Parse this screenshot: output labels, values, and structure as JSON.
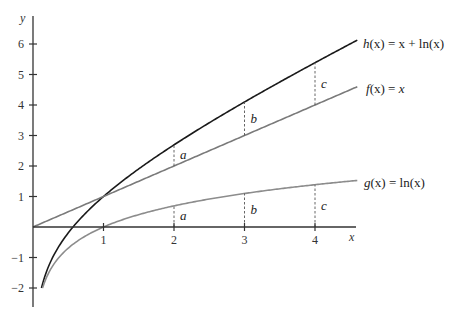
{
  "chart_data": {
    "type": "line",
    "title": "",
    "xlabel": "x",
    "ylabel": "y",
    "xlim": [
      0,
      4.6
    ],
    "ylim": [
      -2.5,
      6.9
    ],
    "grid": false,
    "x_ticks": [
      1,
      2,
      3,
      4
    ],
    "x_tick_labels": [
      "1",
      "2",
      "3",
      "4"
    ],
    "y_ticks": [
      -2,
      -1,
      1,
      2,
      3,
      4,
      5,
      6
    ],
    "y_tick_labels": [
      "−2",
      "−1",
      "1",
      "2",
      "3",
      "4",
      "5",
      "6"
    ],
    "series": [
      {
        "name": "h(x) = x + ln(x)",
        "label_parts": {
          "fn": "h",
          "rhs": "x + ln(x)"
        },
        "color": "#1a1a1a",
        "formula": "x+ln(x)",
        "domain": [
          0.12,
          4.6
        ]
      },
      {
        "name": "f(x) = x",
        "label_parts": {
          "fn": "f",
          "rhs": "x"
        },
        "color": "#7a7a7a",
        "formula": "x",
        "domain": [
          0,
          4.6
        ]
      },
      {
        "name": "g(x) = ln(x)",
        "label_parts": {
          "fn": "g",
          "rhs": "ln(x)"
        },
        "color": "#8c8c8c",
        "formula": "ln(x)",
        "domain": [
          0.135,
          4.6
        ]
      }
    ],
    "annotations": [
      {
        "type": "dashed_segment",
        "x": 2,
        "from": "f",
        "to": "h",
        "label": "a"
      },
      {
        "type": "dashed_segment",
        "x": 3,
        "from": "f",
        "to": "h",
        "label": "b"
      },
      {
        "type": "dashed_segment",
        "x": 4,
        "from": "f",
        "to": "h",
        "label": "c"
      },
      {
        "type": "dashed_segment",
        "x": 2,
        "from": "axis",
        "to": "g",
        "label": "a"
      },
      {
        "type": "dashed_segment",
        "x": 3,
        "from": "axis",
        "to": "g",
        "label": "b"
      },
      {
        "type": "dashed_segment",
        "x": 4,
        "from": "axis",
        "to": "g",
        "label": "c"
      }
    ]
  },
  "labels": {
    "x_axis": "x",
    "y_axis": "y",
    "h": {
      "fn": "h",
      "arg": "(x)",
      "eq": " = ",
      "rhs": "x + ln(x)"
    },
    "f": {
      "fn": "f",
      "arg": "(x)",
      "eq": " = ",
      "rhs": "x"
    },
    "g": {
      "fn": "g",
      "arg": "(x)",
      "eq": " = ",
      "rhs": "ln(x)"
    }
  }
}
